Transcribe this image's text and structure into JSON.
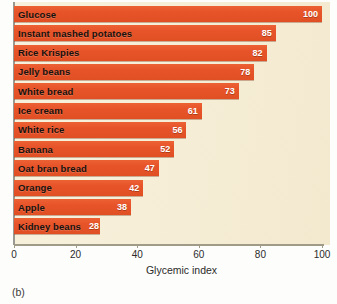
{
  "figure": {
    "caption": "(b)",
    "panel_background": "#f6eed7",
    "bar_color": "#e8542a",
    "axis_color": "#a09b86"
  },
  "chart_data": {
    "type": "bar",
    "orientation": "horizontal",
    "title": "",
    "xlabel": "Glycemic index",
    "ylabel": "",
    "xlim": [
      0,
      100
    ],
    "xticks": [
      0,
      20,
      40,
      60,
      80,
      100
    ],
    "xtick_labels": [
      "0",
      "20",
      "40",
      "60",
      "80",
      "100"
    ],
    "grid": false,
    "legend": null,
    "categories": [
      "Glucose",
      "Instant mashed potatoes",
      "Rice Krispies",
      "Jelly beans",
      "White bread",
      "Ice cream",
      "White rice",
      "Banana",
      "Oat bran bread",
      "Orange",
      "Apple",
      "Kidney beans"
    ],
    "values": [
      100,
      85,
      82,
      78,
      73,
      61,
      56,
      52,
      47,
      42,
      38,
      28
    ],
    "value_labels": [
      "100",
      "85",
      "82",
      "78",
      "73",
      "61",
      "56",
      "52",
      "47",
      "42",
      "38",
      "28"
    ]
  }
}
